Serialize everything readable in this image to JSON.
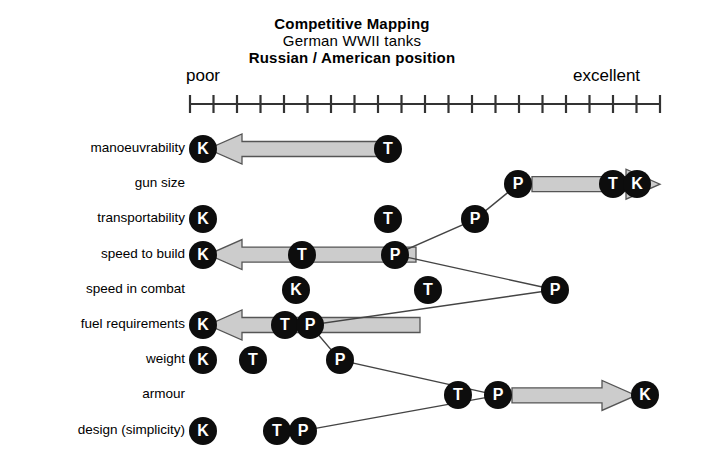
{
  "title": {
    "line1": "Competitive Mapping",
    "line2": "German  WWII  tanks",
    "line3": "Russian / American position"
  },
  "scale": {
    "low_label": "poor",
    "high_label": "excellent",
    "ticks": 21,
    "axis_min": 0,
    "axis_max": 20
  },
  "colors": {
    "marker_fill": "#0d0d0d",
    "marker_text": "#ffffff",
    "arrow_fill": "#cccccc",
    "arrow_stroke": "#555555",
    "line_stroke": "#444444",
    "axis_stroke": "#333333"
  },
  "legend_keys": {
    "K": "K",
    "T": "T",
    "P": "P"
  },
  "rows": [
    {
      "label": "manoeuvrability",
      "markers": [
        {
          "key": "K",
          "x": 203
        },
        {
          "key": "T",
          "x": 388
        }
      ],
      "arrow": {
        "direction": "left",
        "from_x": 388,
        "to_x": 208
      }
    },
    {
      "label": "gun size",
      "markers": [
        {
          "key": "P",
          "x": 518
        },
        {
          "key": "T",
          "x": 613
        },
        {
          "key": "K",
          "x": 637
        }
      ],
      "arrow": {
        "direction": "right",
        "from_x": 532,
        "to_x": 660
      }
    },
    {
      "label": "transportability",
      "markers": [
        {
          "key": "K",
          "x": 203
        },
        {
          "key": "T",
          "x": 388
        },
        {
          "key": "P",
          "x": 475
        }
      ],
      "arrow": null
    },
    {
      "label": "speed to build",
      "markers": [
        {
          "key": "K",
          "x": 203
        },
        {
          "key": "T",
          "x": 302
        },
        {
          "key": "P",
          "x": 395
        }
      ],
      "arrow": {
        "direction": "left",
        "from_x": 416,
        "to_x": 208
      }
    },
    {
      "label": "speed in combat",
      "markers": [
        {
          "key": "K",
          "x": 296
        },
        {
          "key": "T",
          "x": 428
        },
        {
          "key": "P",
          "x": 555
        }
      ],
      "arrow": null
    },
    {
      "label": "fuel requirements",
      "markers": [
        {
          "key": "K",
          "x": 203
        },
        {
          "key": "T",
          "x": 285
        },
        {
          "key": "P",
          "x": 310
        }
      ],
      "arrow": {
        "direction": "left",
        "from_x": 420,
        "to_x": 208
      }
    },
    {
      "label": "weight",
      "markers": [
        {
          "key": "K",
          "x": 203
        },
        {
          "key": "T",
          "x": 253
        },
        {
          "key": "P",
          "x": 340
        }
      ],
      "arrow": null
    },
    {
      "label": "armour",
      "markers": [
        {
          "key": "T",
          "x": 458
        },
        {
          "key": "P",
          "x": 498
        },
        {
          "key": "K",
          "x": 645
        }
      ],
      "arrow": {
        "direction": "right",
        "from_x": 512,
        "to_x": 636
      }
    },
    {
      "label": "design (simplicity)",
      "markers": [
        {
          "key": "K",
          "x": 203
        },
        {
          "key": "T",
          "x": 277
        },
        {
          "key": "P",
          "x": 303
        }
      ],
      "arrow": null
    }
  ],
  "chart_data": {
    "type": "scatter",
    "title": "Competitive Mapping",
    "subtitle": "German  WWII  tanks / Russian / American position",
    "xlabel": "",
    "ylabel": "",
    "xlim": [
      0,
      20
    ],
    "x_low_label": "poor",
    "x_high_label": "excellent",
    "grid": false,
    "legend_position": "none",
    "categories": [
      "manoeuvrability",
      "gun size",
      "transportability",
      "speed to build",
      "speed in combat",
      "fuel requirements",
      "weight",
      "armour",
      "design (simplicity)"
    ],
    "series": [
      {
        "name": "K",
        "values": [
          0.6,
          19.0,
          0.6,
          0.6,
          4.5,
          0.6,
          0.6,
          19.4,
          0.6
        ]
      },
      {
        "name": "T",
        "values": [
          8.4,
          18.0,
          8.4,
          4.8,
          10.1,
          4.0,
          2.7,
          11.4,
          3.7
        ]
      },
      {
        "name": "P",
        "values": [
          12.3,
          14.0,
          12.1,
          8.7,
          15.5,
          5.1,
          6.4,
          13.1,
          4.8
        ]
      }
    ],
    "arrows": [
      {
        "category": "manoeuvrability",
        "direction": "left",
        "from": 8.4,
        "to": 0.8
      },
      {
        "category": "gun size",
        "direction": "right",
        "from": 14.6,
        "to": 20.0
      },
      {
        "category": "speed to build",
        "direction": "left",
        "from": 9.6,
        "to": 0.8
      },
      {
        "category": "fuel requirements",
        "direction": "left",
        "from": 9.8,
        "to": 0.8
      },
      {
        "category": "armour",
        "direction": "right",
        "from": 13.7,
        "to": 19.0
      }
    ]
  }
}
